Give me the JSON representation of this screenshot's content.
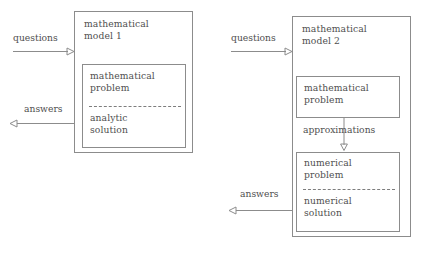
{
  "diagram": {
    "title": "",
    "colors": {
      "background": "#ffffff",
      "stroke": "#8c8c8c",
      "text": "#4f4f4f",
      "dash": "#7d7d7d"
    },
    "panels": [
      {
        "id": "model-1",
        "outer_label": "mathematical\nmodel 1",
        "inner_boxes": [
          {
            "id": "analytic-block",
            "top_label": "mathematical\nproblem",
            "divider": "dashed",
            "bottom_label": "analytic\nsolution"
          }
        ],
        "inputs": [
          {
            "id": "questions-1",
            "label": "questions",
            "direction": "right"
          }
        ],
        "outputs": [
          {
            "id": "answers-1",
            "label": "answers",
            "direction": "left"
          }
        ]
      },
      {
        "id": "model-2",
        "outer_label": "mathematical\nmodel 2",
        "inner_boxes": [
          {
            "id": "math-problem-block",
            "top_label": "mathematical\nproblem",
            "divider": "none",
            "bottom_label": ""
          },
          {
            "id": "numerical-block",
            "top_label": "numerical\nproblem",
            "divider": "dashed",
            "bottom_label": "numerical\nsolution"
          }
        ],
        "internal_arrows": [
          {
            "id": "approximations-arrow",
            "label": "approximations",
            "direction": "down"
          }
        ],
        "inputs": [
          {
            "id": "questions-2",
            "label": "questions",
            "direction": "right"
          }
        ],
        "outputs": [
          {
            "id": "answers-2",
            "label": "answers",
            "direction": "left"
          }
        ]
      }
    ]
  }
}
